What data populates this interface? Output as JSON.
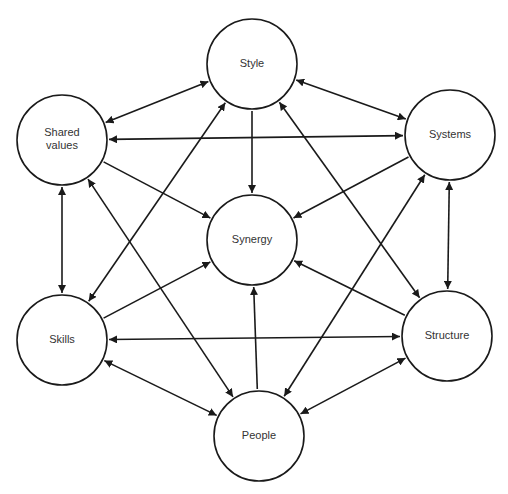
{
  "diagram": {
    "type": "network",
    "colors": {
      "stroke": "#1a1a1a",
      "text": "#333333",
      "background": "#ffffff"
    },
    "nodes": [
      {
        "id": "style",
        "label": [
          "Style"
        ],
        "cx": 252,
        "cy": 64,
        "r": 45
      },
      {
        "id": "shared_values",
        "label": [
          "Shared",
          "values"
        ],
        "cx": 62,
        "cy": 140,
        "r": 45
      },
      {
        "id": "systems",
        "label": [
          "Systems"
        ],
        "cx": 450,
        "cy": 135,
        "r": 45
      },
      {
        "id": "synergy",
        "label": [
          "Synergy"
        ],
        "cx": 252,
        "cy": 240,
        "r": 45
      },
      {
        "id": "skills",
        "label": [
          "Skills"
        ],
        "cx": 62,
        "cy": 340,
        "r": 45
      },
      {
        "id": "structure",
        "label": [
          "Structure"
        ],
        "cx": 447,
        "cy": 336,
        "r": 45
      },
      {
        "id": "people",
        "label": [
          "People"
        ],
        "cx": 259,
        "cy": 436,
        "r": 45
      }
    ],
    "edges": [
      {
        "from": "style",
        "to": "shared_values",
        "direction": "both"
      },
      {
        "from": "style",
        "to": "systems",
        "direction": "both"
      },
      {
        "from": "style",
        "to": "synergy",
        "direction": "forward"
      },
      {
        "from": "shared_values",
        "to": "systems",
        "direction": "both"
      },
      {
        "from": "shared_values",
        "to": "synergy",
        "direction": "forward"
      },
      {
        "from": "systems",
        "to": "synergy",
        "direction": "forward"
      },
      {
        "from": "shared_values",
        "to": "skills",
        "direction": "both"
      },
      {
        "from": "systems",
        "to": "structure",
        "direction": "both"
      },
      {
        "from": "skills",
        "to": "synergy",
        "direction": "forward"
      },
      {
        "from": "structure",
        "to": "synergy",
        "direction": "forward"
      },
      {
        "from": "people",
        "to": "synergy",
        "direction": "forward"
      },
      {
        "from": "skills",
        "to": "structure",
        "direction": "both"
      },
      {
        "from": "skills",
        "to": "people",
        "direction": "both"
      },
      {
        "from": "structure",
        "to": "people",
        "direction": "both"
      },
      {
        "from": "style",
        "to": "skills",
        "direction": "both"
      },
      {
        "from": "style",
        "to": "structure",
        "direction": "both"
      },
      {
        "from": "shared_values",
        "to": "people",
        "direction": "both"
      },
      {
        "from": "systems",
        "to": "people",
        "direction": "both"
      }
    ]
  }
}
